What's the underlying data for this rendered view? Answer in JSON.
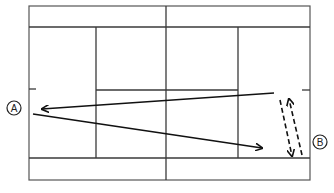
{
  "diagram": {
    "colors": {
      "lines": "#3a3a3a",
      "shots": "#111111",
      "background": "#ffffff"
    },
    "court": {
      "outer": {
        "x": 29,
        "y": 6,
        "width": 281,
        "height": 174
      },
      "singles_top_y": 27,
      "singles_bottom_y": 158,
      "net_x": 166,
      "service_line_left_x": 96,
      "service_line_right_x": 238,
      "center_service_y": 90,
      "center_mark_left": {
        "x1": 29,
        "x2": 36,
        "y": 89
      },
      "center_mark_right": {
        "x1": 302,
        "x2": 310,
        "y": 90
      }
    },
    "players": [
      {
        "id": "A",
        "label": "A",
        "cx": 14,
        "cy": 108,
        "r": 7
      },
      {
        "id": "B",
        "label": "B",
        "cx": 320,
        "cy": 142,
        "r": 7
      }
    ],
    "shots": [
      {
        "name": "shot-b-to-a",
        "style": "solid",
        "x1": 274,
        "y1": 93,
        "x2": 42,
        "y2": 109,
        "arrow": "end"
      },
      {
        "name": "shot-a-to-b",
        "style": "solid",
        "x1": 33,
        "y1": 114,
        "x2": 262,
        "y2": 148,
        "arrow": "end"
      },
      {
        "name": "movement-down",
        "style": "dashed",
        "x1": 280,
        "y1": 100,
        "x2": 292,
        "y2": 156,
        "arrow": "end"
      },
      {
        "name": "movement-up",
        "style": "dashed",
        "x1": 302,
        "y1": 155,
        "x2": 289,
        "y2": 99,
        "arrow": "end"
      }
    ]
  }
}
